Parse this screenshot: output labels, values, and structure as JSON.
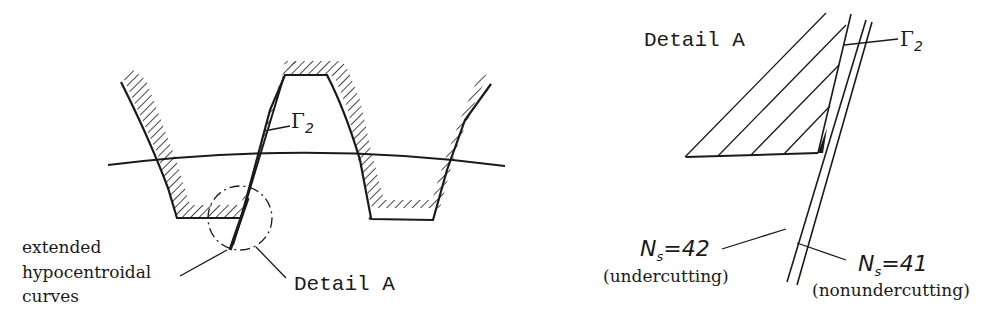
{
  "figure": {
    "left_panel": {
      "curve_label": "Γ",
      "curve_label_sub": "2",
      "callout_label_lines": [
        "extended",
        "hypocentroidal",
        "curves"
      ],
      "detail_label": "Detail A"
    },
    "right_panel": {
      "title": "Detail A",
      "curve_label": "Γ",
      "curve_label_sub": "2",
      "curve_a": {
        "symbol": "N",
        "subscript": "s",
        "value_text": "=42",
        "note": "(undercutting)"
      },
      "curve_b": {
        "symbol": "N",
        "subscript": "s",
        "value_text": "=41",
        "note": "(nonundercutting)"
      }
    },
    "colors": {
      "ink": "#1a1a1a",
      "background": "#ffffff"
    }
  }
}
